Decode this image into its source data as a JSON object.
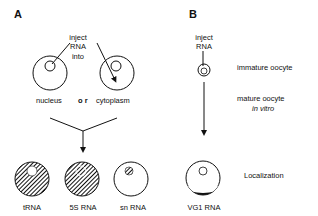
{
  "panels": {
    "a": {
      "label": "A",
      "inject_lines": [
        "inject",
        "RNA",
        "into"
      ],
      "target_labels": {
        "nucleus": "nucleus",
        "or": "o r",
        "cytoplasm": "cytoplasm"
      },
      "results": [
        {
          "label": "tRNA",
          "pattern": "hatched cytoplasm, clear nucleus"
        },
        {
          "label": "5S RNA",
          "pattern": "hatched cytoplasm, hatched nucleus"
        },
        {
          "label": "sn RNA",
          "pattern": "clear cytoplasm, hatched nucleus"
        }
      ]
    },
    "b": {
      "label": "B",
      "inject_lines": [
        "inject",
        "RNA"
      ],
      "stages": {
        "immature": "immature oocyte",
        "mature": "mature oocyte",
        "in_vitro": "in  vitro",
        "localization": "Localization"
      },
      "result_label": "VG1 RNA"
    }
  },
  "colors": {
    "ink": "#111111",
    "background": "#ffffff"
  }
}
